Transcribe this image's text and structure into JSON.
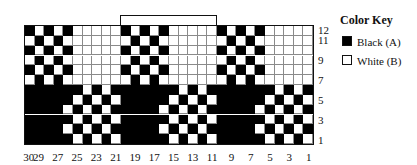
{
  "repeat": {
    "label": "10-st rep",
    "start_col": 20,
    "end_col": 11
  },
  "key": {
    "title": "Color Key",
    "items": [
      {
        "label": "Black (A)",
        "color": "#000000"
      },
      {
        "label": "White (B)",
        "color": "#ffffff"
      }
    ]
  },
  "grid": {
    "columns": 30,
    "rows": 12,
    "row_labels": [
      "12",
      "11",
      "9",
      "7",
      "5",
      "3",
      "1"
    ],
    "col_labels": [
      "30",
      "29",
      "27",
      "25",
      "23",
      "21",
      "19",
      "17",
      "15",
      "13",
      "11",
      "9",
      "7",
      "5",
      "3",
      "1"
    ],
    "repeat_rows": {
      "12": "BWBWBWWWWW",
      "11": "WBWBWWWWWW",
      "10": "BWBWBWWWWW",
      "9": "WBWBWWWWWW",
      "8": "BWBWBWWWWW",
      "7": "WBWBWWWWWW",
      "6": "BBBBBBWBWB",
      "5": "BBBBBWBWBW",
      "4": "BBBBWBWBWB",
      "3": "BBBBBWBWBW",
      "2": "BBBBWBWBWB",
      "1": "BBBBBWBWBW"
    }
  }
}
